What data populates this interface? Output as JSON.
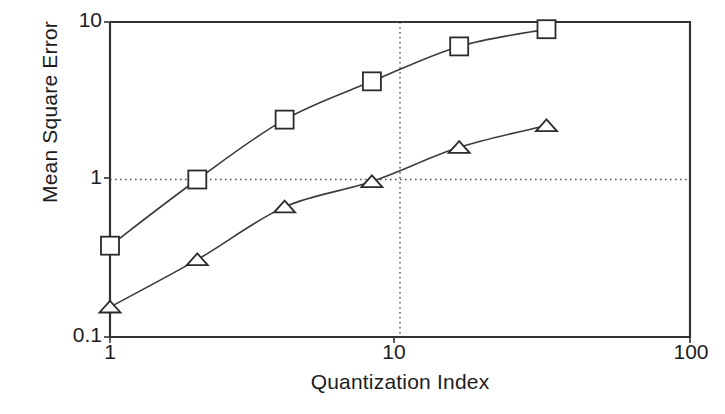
{
  "chart_data": {
    "type": "line",
    "title": "",
    "xlabel": "Quantization Index",
    "ylabel": "Mean Square Error",
    "xscale": "log",
    "yscale": "log",
    "xlim": [
      1,
      100
    ],
    "ylim": [
      0.1,
      10
    ],
    "xticks": [
      1,
      10,
      100
    ],
    "xtick_labels": [
      "1",
      "10",
      "100"
    ],
    "yticks": [
      0.1,
      1,
      10
    ],
    "ytick_labels": [
      "0.1",
      "1",
      "10"
    ],
    "grid": true,
    "gridlines": {
      "horizontal": [
        1
      ],
      "vertical": [
        10
      ],
      "style": "dotted"
    },
    "legend": "none",
    "x": [
      1,
      2,
      4,
      8,
      16,
      32
    ],
    "series": [
      {
        "name": "square-series",
        "marker": "square",
        "values": [
          0.38,
          1.0,
          2.4,
          4.2,
          7.0,
          9.0
        ]
      },
      {
        "name": "triangle-series",
        "marker": "triangle",
        "values": [
          0.155,
          0.31,
          0.67,
          0.97,
          1.6,
          2.2
        ]
      }
    ]
  },
  "axes": {
    "y_title": "Mean Square Error",
    "x_title": "Quantization Index",
    "y_tick_top": "10",
    "y_tick_mid": "1",
    "y_tick_bottom": "0.1",
    "x_tick_left": "1",
    "x_tick_mid": "10",
    "x_tick_right": "100"
  }
}
